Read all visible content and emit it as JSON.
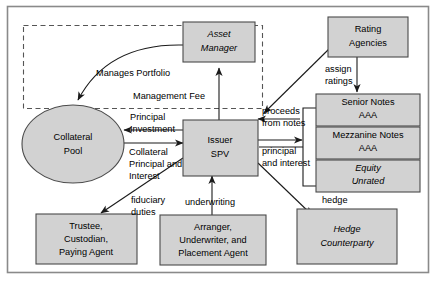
{
  "diagram": {
    "fill_color": "#d2d2d2",
    "stroke_color": "#4a4a4a",
    "frame_color": "#8a8a8a",
    "nodes": [
      {
        "id": "asset_manager",
        "label_lines": [
          "Asset",
          "Manager"
        ],
        "shape": "rect",
        "style": "italic"
      },
      {
        "id": "rating_agencies",
        "label_lines": [
          "Rating",
          "Agencies"
        ],
        "shape": "rect",
        "style": "normal"
      },
      {
        "id": "collateral_pool",
        "label_lines": [
          "Collateral",
          "Pool"
        ],
        "shape": "ellipse",
        "style": "normal"
      },
      {
        "id": "issuer_spv",
        "label_lines": [
          "Issuer",
          "SPV"
        ],
        "shape": "rect",
        "style": "normal"
      },
      {
        "id": "senior_notes",
        "label_lines": [
          "Senior Notes",
          "AAA"
        ],
        "shape": "rect",
        "style": "normal"
      },
      {
        "id": "mezzanine_notes",
        "label_lines": [
          "Mezzanine Notes",
          "AAA"
        ],
        "shape": "rect",
        "style": "normal"
      },
      {
        "id": "equity",
        "label_lines": [
          "Equity",
          "Unrated"
        ],
        "shape": "rect",
        "style": "italic"
      },
      {
        "id": "trustee",
        "label_lines": [
          "Trustee,",
          "Custodian,",
          "Paying Agent"
        ],
        "shape": "rect",
        "style": "normal"
      },
      {
        "id": "arranger",
        "label_lines": [
          "Arranger,",
          "Underwriter, and",
          "Placement Agent"
        ],
        "shape": "rect",
        "style": "normal"
      },
      {
        "id": "hedge_counterparty",
        "label_lines": [
          "Hedge",
          "Counterparty"
        ],
        "shape": "rect",
        "style": "italic"
      }
    ],
    "edge_labels": [
      {
        "id": "manages_portfolio",
        "text": "Manages Portfolio"
      },
      {
        "id": "management_fee",
        "text": "Management Fee"
      },
      {
        "id": "principal_investment_l1",
        "text": "Principal"
      },
      {
        "id": "principal_investment_l2",
        "text": "Investment"
      },
      {
        "id": "collateral_pi_l1",
        "text": "Collateral"
      },
      {
        "id": "collateral_pi_l2",
        "text": "Principal and"
      },
      {
        "id": "collateral_pi_l3",
        "text": "Interest"
      },
      {
        "id": "assign_ratings_l1",
        "text": "assign"
      },
      {
        "id": "assign_ratings_l2",
        "text": "ratings"
      },
      {
        "id": "proceeds_notes_l1",
        "text": "proceeds"
      },
      {
        "id": "proceeds_notes_l2",
        "text": "from notes"
      },
      {
        "id": "principal_interest_l1",
        "text": "principal"
      },
      {
        "id": "principal_interest_l2",
        "text": "and interest"
      },
      {
        "id": "fiduciary_l1",
        "text": "fiduciary"
      },
      {
        "id": "fiduciary_l2",
        "text": "duties"
      },
      {
        "id": "underwriting",
        "text": "underwriting"
      },
      {
        "id": "hedge",
        "text": "hedge"
      }
    ]
  }
}
